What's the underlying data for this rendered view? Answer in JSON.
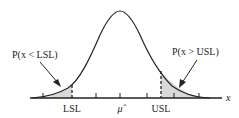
{
  "diagram": {
    "type": "normal-distribution-spec-limits",
    "axis_label": "x",
    "tick_labels": {
      "lsl": "LSL",
      "mean": "μ̂",
      "usl": "USL"
    },
    "annotations": {
      "left_tail": "P(x < LSL)",
      "right_tail": "P(x > USL)"
    },
    "colors": {
      "curve": "#222222",
      "shade": "#d9d9d9",
      "axis": "#222222"
    }
  }
}
